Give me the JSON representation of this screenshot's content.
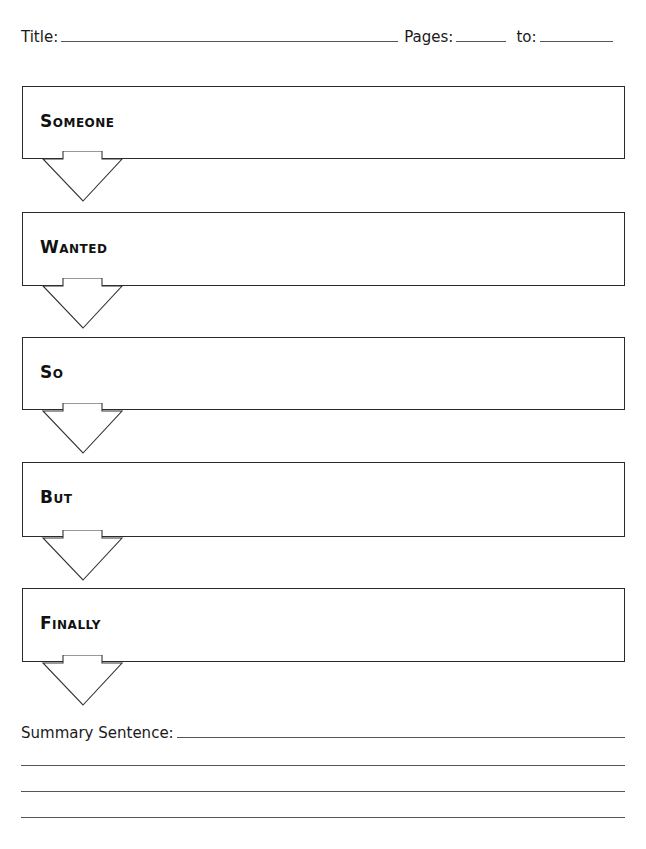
{
  "header": {
    "title_label": "Title:",
    "pages_label": "Pages:",
    "to_label": "to:",
    "title_value": "",
    "pages_from_value": "",
    "pages_to_value": ""
  },
  "boxes": [
    {
      "label": "Someone",
      "value": ""
    },
    {
      "label": "Wanted",
      "value": ""
    },
    {
      "label": "So",
      "value": ""
    },
    {
      "label": "But",
      "value": ""
    },
    {
      "label": "Finally",
      "value": ""
    }
  ],
  "summary": {
    "label": "Summary Sentence:",
    "value": "",
    "extra_lines": 3
  },
  "colors": {
    "ink": "#1a1a1a",
    "border": "#2a2a2a",
    "line": "#555555",
    "background": "#ffffff"
  }
}
